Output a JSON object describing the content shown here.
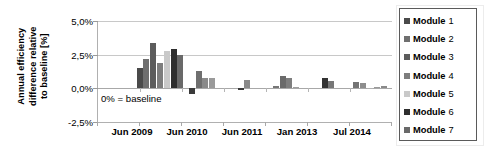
{
  "chart_data": {
    "type": "bar",
    "title": "",
    "subtitle": "",
    "xlabel": "",
    "ylabel": "Annual efficiency difference relative to baseline [%]",
    "ylabel_lines": [
      "Annual efficiency",
      "difference relative",
      "to baseline [%]"
    ],
    "ylim": [
      -2.5,
      5.0
    ],
    "ytick_values": [
      5.0,
      2.5,
      0.0,
      -2.5
    ],
    "ytick_labels": [
      "5,0%",
      "2,5%",
      "0,0%",
      "-2,5%"
    ],
    "xtick_labels": [
      "Jun 2009",
      "Jun 2010",
      "Jun 2011",
      "Jan 2013",
      "Jul 2014"
    ],
    "grid": true,
    "grid_axis": "y",
    "legend_position": "right",
    "annotations": [
      {
        "text": "0% = baseline",
        "x": 0.02,
        "y": -0.9
      }
    ],
    "series": [
      {
        "name": "Module 1",
        "color": "#4a4a4a",
        "values": [
          null,
          1.5,
          -0.45,
          -0.1,
          0.2,
          0.75,
          0.5
        ]
      },
      {
        "name": "Module 2",
        "color": "#6f6f6f",
        "values": [
          null,
          2.2,
          1.3,
          0.65,
          0.9,
          0.55,
          0.4
        ]
      },
      {
        "name": "Module 3",
        "color": "#5c5c5c",
        "values": [
          null,
          3.35,
          0.8,
          null,
          0.75,
          null,
          0.02
        ]
      },
      {
        "name": "Module 4",
        "color": "#7d7d7d",
        "values": [
          null,
          1.85,
          0.75,
          null,
          0.1,
          null,
          0.1
        ]
      },
      {
        "name": "Module 5",
        "color": "#c9c9c9",
        "values": [
          null,
          2.75,
          null,
          null,
          null,
          null,
          0.15
        ]
      },
      {
        "name": "Module 6",
        "color": "#2e2e2e",
        "values": [
          null,
          2.9,
          null,
          null,
          null,
          null,
          null
        ]
      },
      {
        "name": "Module 7",
        "color": "#696969",
        "values": [
          null,
          2.5,
          null,
          null,
          null,
          null,
          null
        ]
      }
    ],
    "groups": [
      {
        "label": "Jun 2009",
        "bars": []
      },
      {
        "label": "Jun 2010",
        "bars": [
          {
            "series": "Module 1",
            "value": 1.5,
            "color": "#4a4a4a"
          },
          {
            "series": "Module 2",
            "value": 2.2,
            "color": "#6f6f6f"
          },
          {
            "series": "Module 3",
            "value": 3.35,
            "color": "#5c5c5c"
          },
          {
            "series": "Module 4",
            "value": 1.85,
            "color": "#7d7d7d"
          },
          {
            "series": "Module 5",
            "value": 2.75,
            "color": "#c9c9c9"
          },
          {
            "series": "Module 6",
            "value": 2.9,
            "color": "#2e2e2e"
          },
          {
            "series": "Module 7",
            "value": 2.5,
            "color": "#696969"
          }
        ]
      },
      {
        "label": "Jun 2011",
        "bars": [
          {
            "series": "Module 1",
            "value": -0.45,
            "color": "#3a3a3a"
          },
          {
            "series": "Module 2",
            "value": 1.3,
            "color": "#6f6f6f"
          },
          {
            "series": "Module 3",
            "value": 0.8,
            "color": "#8a8a8a"
          },
          {
            "series": "Module 4",
            "value": 0.75,
            "color": "#9a9a9a"
          }
        ]
      },
      {
        "label": "",
        "bars": [
          {
            "series": "Module 1",
            "value": -0.12,
            "color": "#3a3a3a"
          },
          {
            "series": "Module 2",
            "value": 0.65,
            "color": "#8a8a8a"
          }
        ]
      },
      {
        "label": "Jan 2013",
        "bars": [
          {
            "series": "Module 1",
            "value": 0.2,
            "color": "#777777"
          },
          {
            "series": "Module 2",
            "value": 0.9,
            "color": "#6a6a6a"
          },
          {
            "series": "Module 3",
            "value": 0.75,
            "color": "#7e7e7e"
          },
          {
            "series": "Module 4",
            "value": 0.1,
            "color": "#a0a0a0"
          }
        ]
      },
      {
        "label": "",
        "bars": [
          {
            "series": "Module 1",
            "value": 0.75,
            "color": "#333333"
          },
          {
            "series": "Module 2",
            "value": 0.55,
            "color": "#777777"
          }
        ]
      },
      {
        "label": "Jul 2014",
        "bars": [
          {
            "series": "Module 1",
            "value": 0.5,
            "color": "#737373"
          },
          {
            "series": "Module 2",
            "value": 0.4,
            "color": "#8d8d8d"
          },
          {
            "series": "Module 3",
            "value": 0.03,
            "color": "#b0b0b0"
          },
          {
            "series": "Module 4",
            "value": 0.1,
            "color": "#9a9a9a"
          },
          {
            "series": "Module 5",
            "value": 0.15,
            "color": "#8a8a8a"
          }
        ]
      }
    ]
  },
  "legend": {
    "items": [
      {
        "label": "Module",
        "number": "1",
        "color": "#4a4a4a"
      },
      {
        "label": "Module",
        "number": "2",
        "color": "#6f6f6f"
      },
      {
        "label": "Module",
        "number": "3",
        "color": "#5c5c5c"
      },
      {
        "label": "Module",
        "number": "4",
        "color": "#7d7d7d"
      },
      {
        "label": "Module",
        "number": "5",
        "color": "#c9c9c9"
      },
      {
        "label": "Module",
        "number": "6",
        "color": "#2e2e2e"
      },
      {
        "label": "Module",
        "number": "7",
        "color": "#696969"
      }
    ]
  }
}
